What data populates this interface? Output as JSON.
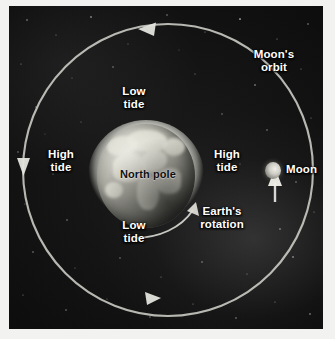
{
  "diagram": {
    "background_color": "#121212",
    "frame_color": "#f2f2f0",
    "label_color": "#ffffff",
    "earth_label_color": "#101010"
  },
  "labels": {
    "moons_orbit": "Moon's\norbit",
    "low_tide_top": "Low\ntide",
    "low_tide_bottom": "Low\ntide",
    "high_tide_left": "High\ntide",
    "high_tide_right": "High\ntide",
    "north_pole": "North pole",
    "earths_rotation": "Earth's\nrotation",
    "moon": "Moon"
  },
  "bodies": {
    "earth": {
      "name": "Earth",
      "center_x": 146,
      "center_y": 176,
      "radius_x": 49,
      "radius_y": 52,
      "has_tidal_bulge": true
    },
    "moon": {
      "name": "Moon",
      "center_x": 273,
      "center_y": 170,
      "radius": 8
    }
  },
  "orbit": {
    "name": "Moon's orbit",
    "center_x": 168,
    "center_y": 170,
    "radius_x": 150,
    "radius_y": 148,
    "direction": "counterclockwise",
    "stroke_color": "#d8d8d2"
  },
  "arrows": {
    "orbit_top": "arrow pointing left along orbit",
    "orbit_left": "arrow pointing down along orbit",
    "orbit_bottom": "arrow pointing right along orbit",
    "earth_rotation": "curved arrow pointing up-right at Earth's equator",
    "moon_pointer": "arrow pointing up at the Moon"
  }
}
